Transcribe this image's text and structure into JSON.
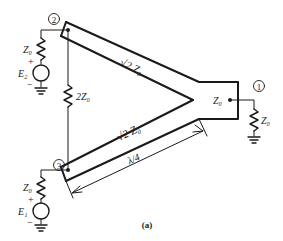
{
  "caption": "(a)",
  "ports": [
    {
      "id": "port-1",
      "label": "1"
    },
    {
      "id": "port-2",
      "label": "2"
    },
    {
      "id": "port-3",
      "label": "3"
    }
  ],
  "labels": {
    "upper_line_impedance": "√2 Z₀",
    "lower_line_impedance": "√2 Z₀",
    "isolation_resistor": "2Z₀",
    "junction_impedance": "Z₀",
    "load_impedance": "Z₀",
    "source2_impedance": "Z₀",
    "source3_impedance": "Z₀",
    "source2_name": "E₂",
    "source3_name": "E₁",
    "length": "λ/4",
    "plus": "+",
    "minus": "−"
  },
  "colors": {
    "stroke": "#1a1a1a",
    "background": "#ffffff"
  }
}
